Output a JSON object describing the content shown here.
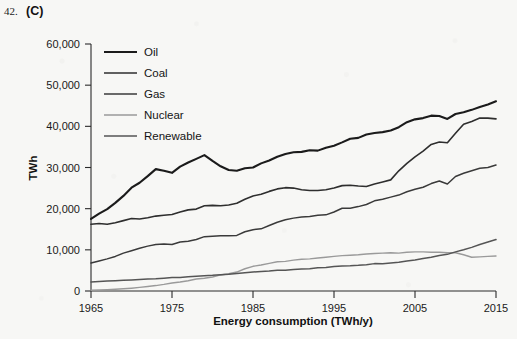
{
  "question": {
    "number": "42.",
    "letter": "(C)"
  },
  "chart_data": {
    "type": "line",
    "title": "",
    "xlabel": "Energy consumption (TWh/y)",
    "ylabel": "TWh",
    "xlim": [
      1965,
      2015
    ],
    "ylim": [
      0,
      60000
    ],
    "xticks": [
      "1965",
      "1975",
      "1985",
      "1995",
      "2005",
      "2015"
    ],
    "yticks": [
      "0",
      "10,000",
      "20,000",
      "30,000",
      "40,000",
      "50,000",
      "60,000"
    ],
    "grid": false,
    "legend_position": "top-left-inside",
    "x": [
      1965,
      1966,
      1967,
      1968,
      1969,
      1970,
      1971,
      1972,
      1973,
      1974,
      1975,
      1976,
      1977,
      1978,
      1979,
      1980,
      1981,
      1982,
      1983,
      1984,
      1985,
      1986,
      1987,
      1988,
      1989,
      1990,
      1991,
      1992,
      1993,
      1994,
      1995,
      1996,
      1997,
      1998,
      1999,
      2000,
      2001,
      2002,
      2003,
      2004,
      2005,
      2006,
      2007,
      2008,
      2009,
      2010,
      2011,
      2012,
      2013,
      2014,
      2015
    ],
    "series": [
      {
        "name": "Oil",
        "color": "#1b1b1b",
        "width": 2.1,
        "values": [
          17500,
          18800,
          19900,
          21400,
          23100,
          25100,
          26300,
          27900,
          29600,
          29200,
          28700,
          30200,
          31200,
          32100,
          33000,
          31600,
          30300,
          29400,
          29200,
          29800,
          30000,
          31000,
          31700,
          32600,
          33300,
          33700,
          33800,
          34200,
          34100,
          34800,
          35300,
          36100,
          37000,
          37200,
          38000,
          38400,
          38600,
          39000,
          39800,
          41000,
          41700,
          42000,
          42600,
          42500,
          41800,
          43000,
          43400,
          44000,
          44700,
          45300,
          46100
        ]
      },
      {
        "name": "Coal",
        "color": "#2e2e2e",
        "width": 1.6,
        "values": [
          16200,
          16400,
          16200,
          16600,
          17100,
          17600,
          17500,
          17800,
          18200,
          18400,
          18600,
          19200,
          19700,
          19900,
          20700,
          20800,
          20700,
          20900,
          21300,
          22300,
          23100,
          23500,
          24200,
          24800,
          25100,
          25000,
          24600,
          24400,
          24400,
          24600,
          25000,
          25600,
          25700,
          25500,
          25400,
          26000,
          26500,
          27000,
          29200,
          31000,
          32600,
          34000,
          35600,
          36200,
          36000,
          38300,
          40500,
          41200,
          42000,
          42000,
          41800
        ]
      },
      {
        "name": "Gas",
        "color": "#3a3a3a",
        "width": 1.5,
        "values": [
          6800,
          7300,
          7800,
          8400,
          9200,
          9800,
          10400,
          10900,
          11300,
          11400,
          11300,
          11900,
          12100,
          12500,
          13200,
          13300,
          13400,
          13400,
          13500,
          14400,
          14900,
          15100,
          15900,
          16700,
          17300,
          17700,
          18000,
          18100,
          18400,
          18500,
          19200,
          20100,
          20100,
          20500,
          21000,
          21900,
          22300,
          22800,
          23300,
          24100,
          24700,
          25200,
          26100,
          26700,
          26000,
          27800,
          28600,
          29200,
          29800,
          30000,
          30600
        ]
      },
      {
        "name": "Nuclear",
        "color": "#9a9a9a",
        "width": 1.4,
        "values": [
          200,
          260,
          330,
          420,
          530,
          680,
          870,
          1100,
          1320,
          1600,
          1950,
          2200,
          2500,
          2900,
          3100,
          3400,
          3900,
          4200,
          4600,
          5400,
          6000,
          6300,
          6700,
          7100,
          7200,
          7500,
          7700,
          7800,
          8000,
          8200,
          8400,
          8600,
          8700,
          8800,
          9000,
          9100,
          9200,
          9300,
          9200,
          9400,
          9500,
          9500,
          9400,
          9400,
          9300,
          9300,
          8800,
          8200,
          8300,
          8400,
          8500
        ]
      },
      {
        "name": "Renewable",
        "color": "#555555",
        "width": 1.5,
        "values": [
          2200,
          2300,
          2400,
          2500,
          2600,
          2700,
          2800,
          2900,
          2950,
          3100,
          3250,
          3300,
          3450,
          3600,
          3700,
          3800,
          3950,
          4050,
          4250,
          4450,
          4600,
          4750,
          4850,
          5050,
          5050,
          5250,
          5350,
          5400,
          5650,
          5700,
          5950,
          6100,
          6150,
          6250,
          6400,
          6650,
          6600,
          6800,
          7000,
          7300,
          7550,
          7900,
          8200,
          8600,
          8900,
          9500,
          10000,
          10600,
          11300,
          11900,
          12500
        ]
      }
    ],
    "legend": [
      {
        "label": "Oil"
      },
      {
        "label": "Coal"
      },
      {
        "label": "Gas"
      },
      {
        "label": "Nuclear"
      },
      {
        "label": "Renewable"
      }
    ]
  }
}
